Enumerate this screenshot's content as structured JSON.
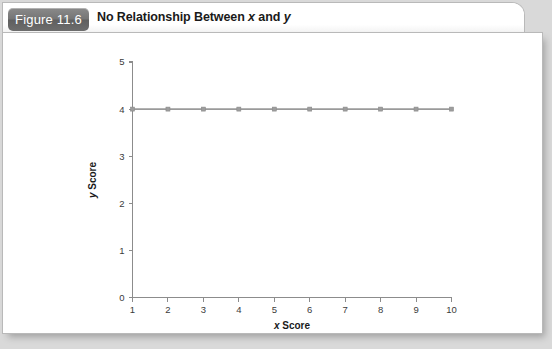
{
  "figure": {
    "tab_label": "Figure 11.6",
    "title_prefix": "No Relationship Between ",
    "title_var1": "x",
    "title_mid": " and ",
    "title_var2": "y"
  },
  "colors": {
    "page_background": "#d9d9d9",
    "panel_background": "#ffffff",
    "tab_background": "#6d6d6d",
    "tab_text": "#ffffff",
    "axis": "#8c8c8c",
    "series": "#9a9a9a",
    "marker": "#9d9d9d",
    "text": "#1a1a1a"
  },
  "chart_data": {
    "type": "line",
    "title": "No Relationship Between x and y",
    "xlabel": "x Score",
    "ylabel": "y Score",
    "xlabel_var": "x",
    "xlabel_rest": " Score",
    "ylabel_var": "y",
    "ylabel_rest": " Score",
    "x": [
      1,
      2,
      3,
      4,
      5,
      6,
      7,
      8,
      9,
      10
    ],
    "values": [
      4,
      4,
      4,
      4,
      4,
      4,
      4,
      4,
      4,
      4
    ],
    "series": [
      {
        "name": "y",
        "values": [
          4,
          4,
          4,
          4,
          4,
          4,
          4,
          4,
          4,
          4
        ]
      }
    ],
    "xlim": [
      1,
      10
    ],
    "ylim": [
      0,
      5
    ],
    "xticks": [
      1,
      2,
      3,
      4,
      5,
      6,
      7,
      8,
      9,
      10
    ],
    "yticks": [
      0,
      1,
      2,
      3,
      4,
      5
    ],
    "xtick_labels": [
      "1",
      "2",
      "3",
      "4",
      "5",
      "6",
      "7",
      "8",
      "9",
      "10"
    ],
    "ytick_labels": [
      "0",
      "1",
      "2",
      "3",
      "4",
      "5"
    ],
    "grid": false,
    "legend": false,
    "marker": "square",
    "marker_size": 4
  }
}
